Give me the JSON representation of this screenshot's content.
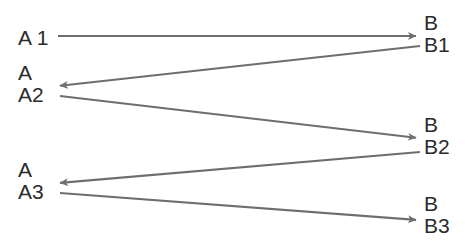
{
  "diagram": {
    "background_color": "#ffffff",
    "line_color": "#6e6e6e",
    "text_color": "#2b2b2b",
    "left_lane": {
      "name": "A",
      "nodes": [
        {
          "id": "a1",
          "head": "",
          "label": "A 1",
          "x": 18,
          "y": 27
        },
        {
          "id": "a2",
          "head": "A",
          "label": "A2",
          "x": 18,
          "y": 62
        },
        {
          "id": "a3",
          "head": "A",
          "label": "A3",
          "x": 18,
          "y": 159
        }
      ]
    },
    "right_lane": {
      "name": "B",
      "nodes": [
        {
          "id": "b1",
          "head": "B",
          "label": "B1",
          "x": 424,
          "y": 12
        },
        {
          "id": "b2",
          "head": "B",
          "label": "B2",
          "x": 424,
          "y": 114
        },
        {
          "id": "b3",
          "head": "B",
          "label": "B3",
          "x": 424,
          "y": 193
        }
      ]
    },
    "arrows": [
      {
        "id": "a1-to-b1",
        "from": "A 1",
        "to": "B1",
        "direction": "right",
        "x1": 58,
        "y1": 36,
        "x2": 418,
        "y2": 36
      },
      {
        "id": "b1-to-a2",
        "from": "B1",
        "to": "A2",
        "direction": "left",
        "x1": 420,
        "y1": 46,
        "x2": 58,
        "y2": 86
      },
      {
        "id": "a2-to-b2",
        "from": "A2",
        "to": "B2",
        "direction": "right",
        "x1": 60,
        "y1": 96,
        "x2": 418,
        "y2": 138
      },
      {
        "id": "b2-to-a3",
        "from": "B2",
        "to": "A3",
        "direction": "left",
        "x1": 420,
        "y1": 152,
        "x2": 58,
        "y2": 183
      },
      {
        "id": "a3-to-b3",
        "from": "A3",
        "to": "B3",
        "direction": "right",
        "x1": 60,
        "y1": 193,
        "x2": 418,
        "y2": 220
      }
    ]
  }
}
